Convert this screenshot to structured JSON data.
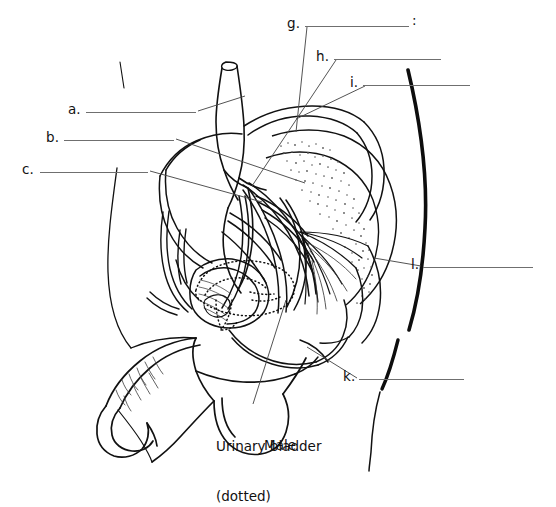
{
  "figure": {
    "title_bottom": "Male",
    "annotation_caption": "Urinary bladder\n(dotted)",
    "caption_line1": "Urinary bladder",
    "caption_line2": "(dotted)",
    "background_color": "#ffffff",
    "ink_color": "#111111",
    "answer_line_color": "#6f6f6f",
    "leader_line_color": "#4a4a4a"
  },
  "labels": [
    {
      "id": "a",
      "letter": "a.",
      "text_x": 68,
      "text_y": 103,
      "line_x1": 86,
      "line_x2": 196,
      "line_y": 112,
      "answer": ""
    },
    {
      "id": "b",
      "letter": "b.",
      "text_x": 46,
      "text_y": 131,
      "line_x1": 64,
      "line_x2": 174,
      "line_y": 140,
      "answer": ""
    },
    {
      "id": "c",
      "letter": "c.",
      "text_x": 22,
      "text_y": 163,
      "line_x1": 40,
      "line_x2": 148,
      "line_y": 172,
      "answer": ""
    },
    {
      "id": "g",
      "letter": "g.",
      "text_x": 287,
      "text_y": 17,
      "line_x1": 305,
      "line_x2": 409,
      "line_y": 26,
      "answer": "",
      "suffix": ":"
    },
    {
      "id": "h",
      "letter": "h.",
      "text_x": 316,
      "text_y": 50,
      "line_x1": 334,
      "line_x2": 441,
      "line_y": 59,
      "answer": ""
    },
    {
      "id": "i",
      "letter": "i.",
      "text_x": 350,
      "text_y": 76,
      "line_x1": 363,
      "line_x2": 470,
      "line_y": 85,
      "answer": ""
    },
    {
      "id": "l",
      "letter": "l.",
      "text_x": 411,
      "text_y": 258,
      "line_x1": 423,
      "line_x2": 533,
      "line_y": 267,
      "answer": ""
    },
    {
      "id": "k",
      "letter": "k.",
      "text_x": 343,
      "text_y": 370,
      "line_x1": 359,
      "line_x2": 464,
      "line_y": 379,
      "answer": ""
    }
  ],
  "label_letters": [
    "a.",
    "b.",
    "c.",
    "g.",
    "h.",
    "i.",
    "l.",
    "k."
  ],
  "diagram": {
    "name": "male-pelvis-sagittal-section",
    "dotted_structure": "urinary bladder"
  }
}
